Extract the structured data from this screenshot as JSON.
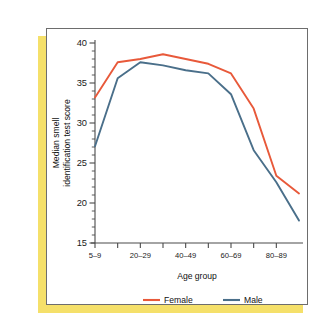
{
  "figure": {
    "panel_border_color": "#6d6d6d",
    "shadow_color": "#f5e06a",
    "background_color": "#ffffff"
  },
  "chart_data": {
    "type": "line",
    "title": "",
    "xlabel": "Age group",
    "ylabel": "Median smell identification test score",
    "ylabel_line1": "Median smell",
    "ylabel_line2": "identification test score",
    "categories": [
      "5–9",
      "10–19",
      "20–29",
      "30–39",
      "40–49",
      "50–59",
      "60–69",
      "70–79",
      "80–89",
      "90+"
    ],
    "xtick_labels": [
      "5–9",
      "",
      "20–29",
      "",
      "40–49",
      "",
      "60–69",
      "",
      "80–89"
    ],
    "xtick_count": 9,
    "ylim": [
      15,
      40
    ],
    "ytick_labels": [
      "15",
      "20",
      "25",
      "30",
      "35",
      "40"
    ],
    "ytick_values": [
      15,
      20,
      25,
      30,
      35,
      40
    ],
    "yminor_step": 1,
    "grid": false,
    "legend_position": "below",
    "series": [
      {
        "name": "Female",
        "color": "#e8593a",
        "values": [
          33.2,
          37.6,
          38.0,
          38.6,
          38.0,
          37.4,
          36.2,
          31.8,
          23.4,
          21.2
        ]
      },
      {
        "name": "Male",
        "color": "#4a6f8a",
        "values": [
          27.1,
          35.6,
          37.6,
          37.2,
          36.6,
          36.2,
          33.6,
          26.6,
          22.6,
          17.8
        ]
      }
    ]
  },
  "legend": {
    "items": [
      {
        "label": "Female",
        "color": "#e8593a"
      },
      {
        "label": "Male",
        "color": "#4a6f8a"
      }
    ]
  }
}
